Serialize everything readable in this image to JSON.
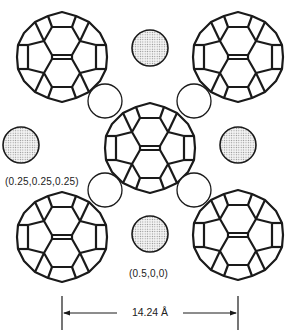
{
  "figure": {
    "colors": {
      "line": "#1a1a1a",
      "shaded_fill": "#d8d8d8",
      "background": "#ffffff"
    },
    "molecules": [
      {
        "id": "c60-top-left",
        "cx": 62,
        "cy": 57,
        "r": 45
      },
      {
        "id": "c60-top-right",
        "cx": 238,
        "cy": 57,
        "r": 45
      },
      {
        "id": "c60-center",
        "cx": 150,
        "cy": 148,
        "r": 45
      },
      {
        "id": "c60-bottom-left",
        "cx": 62,
        "cy": 237,
        "r": 45
      },
      {
        "id": "c60-bottom-right",
        "cx": 238,
        "cy": 235,
        "r": 45
      }
    ],
    "octahedral_sites": [
      {
        "cx": 150,
        "cy": 48,
        "r": 18
      },
      {
        "cx": 21,
        "cy": 145,
        "r": 18
      },
      {
        "cx": 238,
        "cy": 145,
        "r": 18
      },
      {
        "cx": 150,
        "cy": 234,
        "r": 18
      }
    ],
    "tetrahedral_sites": [
      {
        "cx": 105,
        "cy": 101,
        "r": 17
      },
      {
        "cx": 194,
        "cy": 101,
        "r": 17
      },
      {
        "cx": 105,
        "cy": 190,
        "r": 17
      },
      {
        "cx": 194,
        "cy": 190,
        "r": 17
      }
    ],
    "labels": {
      "tetrahedral_coord": "(0.25,0.25,0.25)",
      "octahedral_coord": "(0.5,0,0)"
    },
    "dimension": {
      "text": "14.24 Å",
      "value": 14.24,
      "unit": "Å",
      "x_start": 62,
      "x_end": 238,
      "y": 313
    }
  }
}
